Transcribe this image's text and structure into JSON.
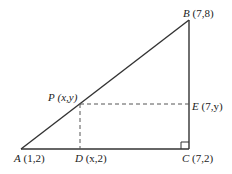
{
  "diagram": {
    "type": "right-triangle",
    "points": {
      "A": {
        "name": "A",
        "coords": "(1,2)"
      },
      "B": {
        "name": "B",
        "coords": "(7,8)"
      },
      "C": {
        "name": "C",
        "coords": "(7,2)"
      },
      "P": {
        "name": "P",
        "coords": "(x,y)"
      },
      "D": {
        "name": "D",
        "coords": "(x,2)"
      },
      "E": {
        "name": "E",
        "coords": "(7,y)"
      }
    },
    "right_angle_at": "C",
    "dashed_segments": [
      "PD",
      "PE"
    ],
    "solid_segments": [
      "AB",
      "BC",
      "CA"
    ],
    "colors": {
      "line": "#333333",
      "background": "#ffffff"
    }
  }
}
